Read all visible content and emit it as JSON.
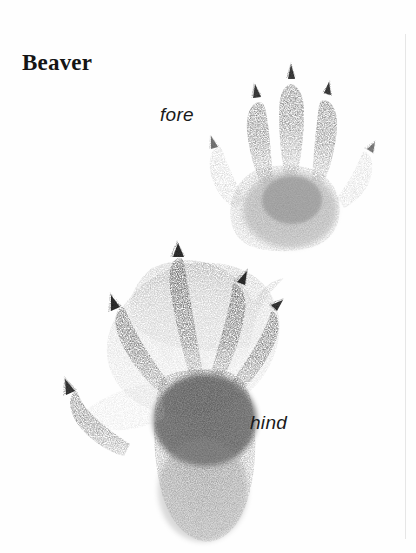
{
  "page": {
    "title": "Beaver",
    "background_color": "#fefefe",
    "ink_color": "#2b2b2b",
    "rule_color": "#e6e6e6"
  },
  "labels": {
    "fore": "fore",
    "hind": "hind"
  },
  "figures": [
    {
      "name": "fore-track",
      "label": "fore",
      "digits": 5,
      "description": "beaver front foot print, five slender toes each tipped with a sharp claw mark, small rounded palm pad",
      "ink_color": "#3a3a3a"
    },
    {
      "name": "hind-track",
      "label": "hind",
      "digits": 5,
      "description": "beaver hind foot print, five clawed toes joined by webbing, long dark heel pad",
      "ink_color": "#2b2b2b"
    }
  ]
}
